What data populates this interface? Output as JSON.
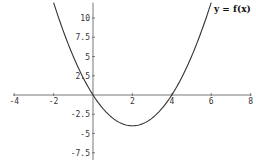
{
  "chart_data": {
    "type": "line",
    "title": "",
    "annotation": "y = f(x)",
    "xlabel": "",
    "ylabel": "",
    "xlim": [
      -4,
      8
    ],
    "ylim": [
      -8.5,
      12
    ],
    "x_ticks": [
      -4,
      -2,
      2,
      4,
      6,
      8
    ],
    "x_tick_labels": [
      "-4",
      "-2",
      "2",
      "4",
      "6",
      "8"
    ],
    "y_ticks": [
      10,
      7.5,
      5,
      2.5,
      -2.5,
      -5,
      -7.5
    ],
    "y_tick_labels": [
      "10",
      "7.5",
      "5",
      "2.5",
      "-2.5",
      "-5",
      "-7.5"
    ],
    "grid": false,
    "series": [
      {
        "name": "y = f(x)",
        "function": "x^2 - 4x",
        "x": [
          -2,
          -1.5,
          -1,
          -0.5,
          0,
          0.5,
          1,
          1.5,
          2,
          2.5,
          3,
          3.5,
          4,
          4.5,
          5,
          5.5,
          6
        ],
        "y": [
          12,
          8.25,
          5,
          2.25,
          0,
          -1.75,
          -3,
          -3.75,
          -4,
          -3.75,
          -3,
          -1.75,
          0,
          2.25,
          5,
          8.25,
          12
        ],
        "color": "#333333"
      }
    ]
  },
  "colors": {
    "axis": "#555555",
    "curve": "#333333",
    "background": "#ffffff"
  }
}
